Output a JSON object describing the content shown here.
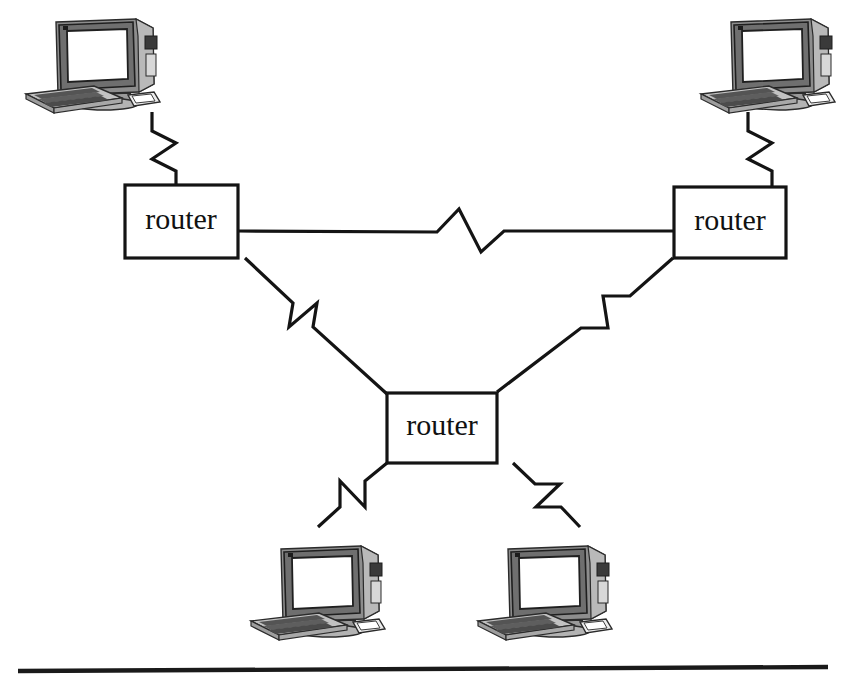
{
  "diagram": {
    "type": "network-topology",
    "canvas": {
      "width": 845,
      "height": 684
    },
    "background_color": "#ffffff",
    "line_color": "#141414",
    "label_color": "#111111",
    "routers": [
      {
        "id": "router-left",
        "label": "router",
        "x": 125,
        "y": 185,
        "w": 113,
        "h": 73,
        "label_x": 181,
        "label_y": 222
      },
      {
        "id": "router-right",
        "label": "router",
        "x": 674,
        "y": 187,
        "w": 112,
        "h": 71,
        "label_x": 730,
        "label_y": 223
      },
      {
        "id": "router-center",
        "label": "router",
        "x": 387,
        "y": 393,
        "w": 110,
        "h": 70,
        "label_x": 442,
        "label_y": 428
      }
    ],
    "workstations": [
      {
        "id": "workstation-top-left",
        "x": 18,
        "y": 16,
        "w": 148,
        "h": 103
      },
      {
        "id": "workstation-top-right",
        "x": 693,
        "y": 16,
        "w": 148,
        "h": 103
      },
      {
        "id": "workstation-bottom-left",
        "x": 243,
        "y": 543,
        "w": 148,
        "h": 103
      },
      {
        "id": "workstation-bottom-right",
        "x": 470,
        "y": 543,
        "w": 148,
        "h": 103
      }
    ],
    "links": [
      {
        "id": "link-top-left-pc-to-router-left",
        "from": "workstation-top-left",
        "to": "router-left",
        "style": "zigzag-vertical",
        "path": "M 152 112 L 152 131 L 176 143 L 152 159 L 176 171 L 176 185"
      },
      {
        "id": "link-top-right-pc-to-router-right",
        "from": "workstation-top-right",
        "to": "router-right",
        "style": "zigzag-vertical",
        "path": "M 748 112 L 748 131 L 772 143 L 748 159 L 772 171 L 772 187"
      },
      {
        "id": "link-router-left-to-router-right",
        "from": "router-left",
        "to": "router-right",
        "style": "zigzag-horizontal",
        "path": "M 238 231 L 437 232 L 459 209 L 481 252 L 504 231 L 674 231"
      },
      {
        "id": "link-router-left-to-router-center",
        "from": "router-left",
        "to": "router-center",
        "style": "zigzag-diagonal",
        "path": "M 245 258 L 293 303 L 289 327 L 317 303 L 313 327 L 387 394"
      },
      {
        "id": "link-router-center-to-router-right",
        "from": "router-center",
        "to": "router-right",
        "style": "zigzag-diagonal",
        "path": "M 497 392 L 581 328 L 608 328 L 603 296 L 630 296 L 673 258"
      },
      {
        "id": "link-router-center-to-bottom-left-pc",
        "from": "router-center",
        "to": "workstation-bottom-left",
        "style": "zigzag-diagonal",
        "path": "M 387 463 L 365 481 L 365 507 L 340 481 L 340 507 L 318 527"
      },
      {
        "id": "link-router-center-to-bottom-right-pc",
        "from": "router-center",
        "to": "workstation-bottom-right",
        "style": "zigzag-diagonal",
        "path": "M 513 463 L 535 484 L 560 484 L 536 507 L 561 507 L 580 527"
      }
    ],
    "baseline_rule": {
      "id": "baseline-rule",
      "x1": 18,
      "y1": 671,
      "x2": 828,
      "y2": 667
    }
  }
}
